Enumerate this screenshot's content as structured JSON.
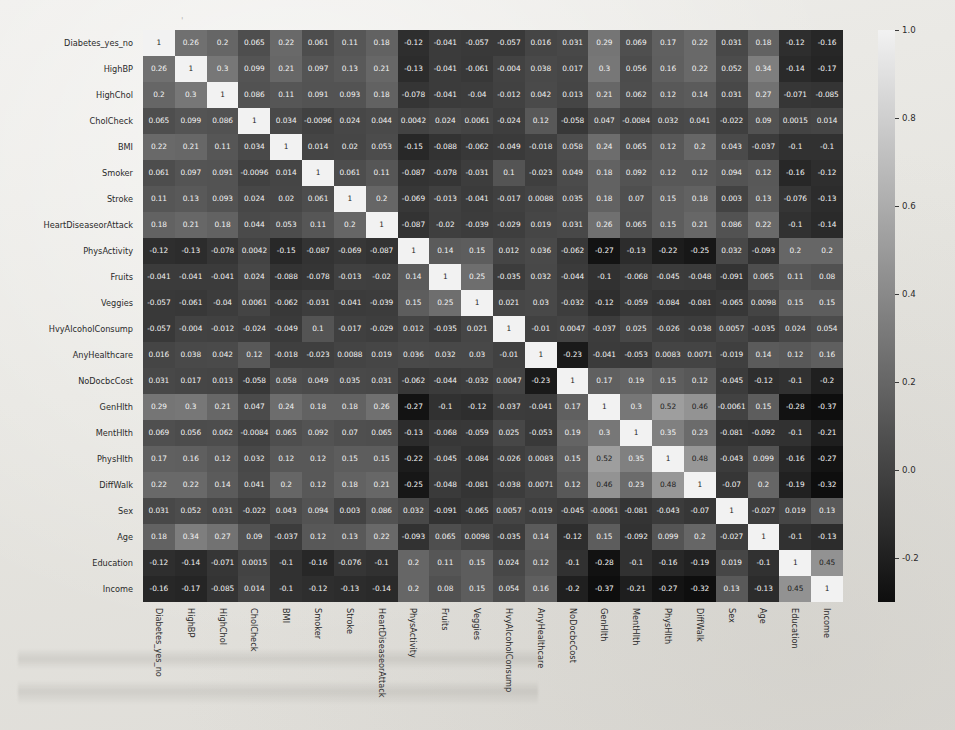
{
  "chart_data": {
    "type": "heatmap",
    "title": "",
    "xlabel": "",
    "ylabel": "",
    "colormap": "gray",
    "grid": false,
    "annotated": true,
    "legend_position": "right",
    "colorbar": {
      "vmin": -0.3,
      "vmax": 1.0,
      "ticks": [
        1.0,
        0.8,
        0.6,
        0.4,
        0.2,
        0.0,
        -0.2
      ],
      "tick_labels": [
        "1.0",
        "0.8",
        "0.6",
        "0.4",
        "0.2",
        "0.0",
        "-0.2"
      ],
      "low_color": "#1a1a1a",
      "high_color": "#f0f0f0"
    },
    "categories": [
      "Diabetes_yes_no",
      "HighBP",
      "HighChol",
      "CholCheck",
      "BMI",
      "Smoker",
      "Stroke",
      "HeartDiseaseorAttack",
      "PhysActivity",
      "Fruits",
      "Veggies",
      "HvyAlcoholConsump",
      "AnyHealthcare",
      "NoDocbcCost",
      "GenHlth",
      "MentHlth",
      "PhysHlth",
      "DiffWalk",
      "Sex",
      "Age",
      "Education",
      "Income"
    ],
    "x": [
      "Diabetes_yes_no",
      "HighBP",
      "HighChol",
      "CholCheck",
      "BMI",
      "Smoker",
      "Stroke",
      "HeartDiseaseorAttack",
      "PhysActivity",
      "Fruits",
      "Veggies",
      "HvyAlcoholConsump",
      "AnyHealthcare",
      "NoDocbcCost",
      "GenHlth",
      "MentHlth",
      "PhysHlth",
      "DiffWalk",
      "Sex",
      "Age",
      "Education",
      "Income"
    ],
    "y": [
      "Diabetes_yes_no",
      "HighBP",
      "HighChol",
      "CholCheck",
      "BMI",
      "Smoker",
      "Stroke",
      "HeartDiseaseorAttack",
      "PhysActivity",
      "Fruits",
      "Veggies",
      "HvyAlcoholConsump",
      "AnyHealthcare",
      "NoDocbcCost",
      "GenHlth",
      "MentHlth",
      "PhysHlth",
      "DiffWalk",
      "Sex",
      "Age",
      "Education",
      "Income"
    ],
    "cell_labels": [
      [
        "1",
        "0.26",
        "0.2",
        "0.065",
        "0.22",
        "0.061",
        "0.11",
        "0.18",
        "-0.12",
        "-0.041",
        "-0.057",
        "-0.057",
        "0.016",
        "0.031",
        "0.29",
        "0.069",
        "0.17",
        "0.22",
        "0.031",
        "0.18",
        "-0.12",
        "-0.16"
      ],
      [
        "0.26",
        "1",
        "0.3",
        "0.099",
        "0.21",
        "0.097",
        "0.13",
        "0.21",
        "-0.13",
        "-0.041",
        "-0.061",
        "-0.004",
        "0.038",
        "0.017",
        "0.3",
        "0.056",
        "0.16",
        "0.22",
        "0.052",
        "0.34",
        "-0.14",
        "-0.17"
      ],
      [
        "0.2",
        "0.3",
        "1",
        "0.086",
        "0.11",
        "0.091",
        "0.093",
        "0.18",
        "-0.078",
        "-0.041",
        "-0.04",
        "-0.012",
        "0.042",
        "0.013",
        "0.21",
        "0.062",
        "0.12",
        "0.14",
        "0.031",
        "0.27",
        "-0.071",
        "-0.085"
      ],
      [
        "0.065",
        "0.099",
        "0.086",
        "1",
        "0.034",
        "-0.0096",
        "0.024",
        "0.044",
        "0.0042",
        "0.024",
        "0.0061",
        "-0.024",
        "0.12",
        "-0.058",
        "0.047",
        "-0.0084",
        "0.032",
        "0.041",
        "-0.022",
        "0.09",
        "0.0015",
        "0.014"
      ],
      [
        "0.22",
        "0.21",
        "0.11",
        "0.034",
        "1",
        "0.014",
        "0.02",
        "0.053",
        "-0.15",
        "-0.088",
        "-0.062",
        "-0.049",
        "-0.018",
        "0.058",
        "0.24",
        "0.065",
        "0.12",
        "0.2",
        "0.043",
        "-0.037",
        "-0.1",
        "-0.1"
      ],
      [
        "0.061",
        "0.097",
        "0.091",
        "-0.0096",
        "0.014",
        "1",
        "0.061",
        "0.11",
        "-0.087",
        "-0.078",
        "-0.031",
        "0.1",
        "-0.023",
        "0.049",
        "0.18",
        "0.092",
        "0.12",
        "0.12",
        "0.094",
        "0.12",
        "-0.16",
        "-0.12"
      ],
      [
        "0.11",
        "0.13",
        "0.093",
        "0.024",
        "0.02",
        "0.061",
        "1",
        "0.2",
        "-0.069",
        "-0.013",
        "-0.041",
        "-0.017",
        "0.0088",
        "0.035",
        "0.18",
        "0.07",
        "0.15",
        "0.18",
        "0.003",
        "0.13",
        "-0.076",
        "-0.13"
      ],
      [
        "0.18",
        "0.21",
        "0.18",
        "0.044",
        "0.053",
        "0.11",
        "0.2",
        "1",
        "-0.087",
        "-0.02",
        "-0.039",
        "-0.029",
        "0.019",
        "0.031",
        "0.26",
        "0.065",
        "0.15",
        "0.21",
        "0.086",
        "0.22",
        "-0.1",
        "-0.14"
      ],
      [
        "-0.12",
        "-0.13",
        "-0.078",
        "0.0042",
        "-0.15",
        "-0.087",
        "-0.069",
        "-0.087",
        "1",
        "0.14",
        "0.15",
        "0.012",
        "0.036",
        "-0.062",
        "-0.27",
        "-0.13",
        "-0.22",
        "-0.25",
        "0.032",
        "-0.093",
        "0.2",
        "0.2"
      ],
      [
        "-0.041",
        "-0.041",
        "-0.041",
        "0.024",
        "-0.088",
        "-0.078",
        "-0.013",
        "-0.02",
        "0.14",
        "1",
        "0.25",
        "-0.035",
        "0.032",
        "-0.044",
        "-0.1",
        "-0.068",
        "-0.045",
        "-0.048",
        "-0.091",
        "0.065",
        "0.11",
        "0.08"
      ],
      [
        "-0.057",
        "-0.061",
        "-0.04",
        "0.0061",
        "-0.062",
        "-0.031",
        "-0.041",
        "-0.039",
        "0.15",
        "0.25",
        "1",
        "0.021",
        "0.03",
        "-0.032",
        "-0.12",
        "-0.059",
        "-0.084",
        "-0.081",
        "-0.065",
        "0.0098",
        "0.15",
        "0.15"
      ],
      [
        "-0.057",
        "-0.004",
        "-0.012",
        "-0.024",
        "-0.049",
        "0.1",
        "-0.017",
        "-0.029",
        "0.012",
        "-0.035",
        "0.021",
        "1",
        "-0.01",
        "0.0047",
        "-0.037",
        "0.025",
        "-0.026",
        "-0.038",
        "0.0057",
        "-0.035",
        "0.024",
        "0.054"
      ],
      [
        "0.016",
        "0.038",
        "0.042",
        "0.12",
        "-0.018",
        "-0.023",
        "0.0088",
        "0.019",
        "0.036",
        "0.032",
        "0.03",
        "-0.01",
        "1",
        "-0.23",
        "-0.041",
        "-0.053",
        "0.0083",
        "0.0071",
        "-0.019",
        "0.14",
        "0.12",
        "0.16"
      ],
      [
        "0.031",
        "0.017",
        "0.013",
        "-0.058",
        "0.058",
        "0.049",
        "0.035",
        "0.031",
        "-0.062",
        "-0.044",
        "-0.032",
        "0.0047",
        "-0.23",
        "1",
        "0.17",
        "0.19",
        "0.15",
        "0.12",
        "-0.045",
        "-0.12",
        "-0.1",
        "-0.2"
      ],
      [
        "0.29",
        "0.3",
        "0.21",
        "0.047",
        "0.24",
        "0.18",
        "0.18",
        "0.26",
        "-0.27",
        "-0.1",
        "-0.12",
        "-0.037",
        "-0.041",
        "0.17",
        "1",
        "0.3",
        "0.52",
        "0.46",
        "-0.0061",
        "0.15",
        "-0.28",
        "-0.37"
      ],
      [
        "0.069",
        "0.056",
        "0.062",
        "-0.0084",
        "0.065",
        "0.092",
        "0.07",
        "0.065",
        "-0.13",
        "-0.068",
        "-0.059",
        "0.025",
        "-0.053",
        "0.19",
        "0.3",
        "1",
        "0.35",
        "0.23",
        "-0.081",
        "-0.092",
        "-0.1",
        "-0.21"
      ],
      [
        "0.17",
        "0.16",
        "0.12",
        "0.032",
        "0.12",
        "0.12",
        "0.15",
        "0.15",
        "-0.22",
        "-0.045",
        "-0.084",
        "-0.026",
        "0.0083",
        "0.15",
        "0.52",
        "0.35",
        "1",
        "0.48",
        "-0.043",
        "0.099",
        "-0.16",
        "-0.27"
      ],
      [
        "0.22",
        "0.22",
        "0.14",
        "0.041",
        "0.2",
        "0.12",
        "0.18",
        "0.21",
        "-0.25",
        "-0.048",
        "-0.081",
        "-0.038",
        "0.0071",
        "0.12",
        "0.46",
        "0.23",
        "0.48",
        "1",
        "-0.07",
        "0.2",
        "-0.19",
        "-0.32"
      ],
      [
        "0.031",
        "0.052",
        "0.031",
        "-0.022",
        "0.043",
        "0.094",
        "0.003",
        "0.086",
        "0.032",
        "-0.091",
        "-0.065",
        "0.0057",
        "-0.019",
        "-0.045",
        "-0.0061",
        "-0.081",
        "-0.043",
        "-0.07",
        "1",
        "-0.027",
        "0.019",
        "0.13"
      ],
      [
        "0.18",
        "0.34",
        "0.27",
        "0.09",
        "-0.037",
        "0.12",
        "0.13",
        "0.22",
        "-0.093",
        "0.065",
        "0.0098",
        "-0.035",
        "0.14",
        "-0.12",
        "0.15",
        "-0.092",
        "0.099",
        "0.2",
        "-0.027",
        "1",
        "-0.1",
        "-0.13"
      ],
      [
        "-0.12",
        "-0.14",
        "-0.071",
        "0.0015",
        "-0.1",
        "-0.16",
        "-0.076",
        "-0.1",
        "0.2",
        "0.11",
        "0.15",
        "0.024",
        "0.12",
        "-0.1",
        "-0.28",
        "-0.1",
        "-0.16",
        "-0.19",
        "0.019",
        "-0.1",
        "1",
        "0.45"
      ],
      [
        "-0.16",
        "-0.17",
        "-0.085",
        "0.014",
        "-0.1",
        "-0.12",
        "-0.13",
        "-0.14",
        "0.2",
        "0.08",
        "0.15",
        "0.054",
        "0.16",
        "-0.2",
        "-0.37",
        "-0.21",
        "-0.27",
        "-0.32",
        "0.13",
        "-0.13",
        "0.45",
        "1"
      ]
    ],
    "values": [
      [
        1,
        0.26,
        0.2,
        0.065,
        0.22,
        0.061,
        0.11,
        0.18,
        -0.12,
        -0.041,
        -0.057,
        -0.057,
        0.016,
        0.031,
        0.29,
        0.069,
        0.17,
        0.22,
        0.031,
        0.18,
        -0.12,
        -0.16
      ],
      [
        0.26,
        1,
        0.3,
        0.099,
        0.21,
        0.097,
        0.13,
        0.21,
        -0.13,
        -0.041,
        -0.061,
        -0.004,
        0.038,
        0.017,
        0.3,
        0.056,
        0.16,
        0.22,
        0.052,
        0.34,
        -0.14,
        -0.17
      ],
      [
        0.2,
        0.3,
        1,
        0.086,
        0.11,
        0.091,
        0.093,
        0.18,
        -0.078,
        -0.041,
        -0.04,
        -0.012,
        0.042,
        0.013,
        0.21,
        0.062,
        0.12,
        0.14,
        0.031,
        0.27,
        -0.071,
        -0.085
      ],
      [
        0.065,
        0.099,
        0.086,
        1,
        0.034,
        -0.0096,
        0.024,
        0.044,
        0.0042,
        0.024,
        0.0061,
        -0.024,
        0.12,
        -0.058,
        0.047,
        -0.0084,
        0.032,
        0.041,
        -0.022,
        0.09,
        0.0015,
        0.014
      ],
      [
        0.22,
        0.21,
        0.11,
        0.034,
        1,
        0.014,
        0.02,
        0.053,
        -0.15,
        -0.088,
        -0.062,
        -0.049,
        -0.018,
        0.058,
        0.24,
        0.065,
        0.12,
        0.2,
        0.043,
        -0.037,
        -0.1,
        -0.1
      ],
      [
        0.061,
        0.097,
        0.091,
        -0.0096,
        0.014,
        1,
        0.061,
        0.11,
        -0.087,
        -0.078,
        -0.031,
        0.1,
        -0.023,
        0.049,
        0.18,
        0.092,
        0.12,
        0.12,
        0.094,
        0.12,
        -0.16,
        -0.12
      ],
      [
        0.11,
        0.13,
        0.093,
        0.024,
        0.02,
        0.061,
        1,
        0.2,
        -0.069,
        -0.013,
        -0.041,
        -0.017,
        0.0088,
        0.035,
        0.18,
        0.07,
        0.15,
        0.18,
        0.003,
        0.13,
        -0.076,
        -0.13
      ],
      [
        0.18,
        0.21,
        0.18,
        0.044,
        0.053,
        0.11,
        0.2,
        1,
        -0.087,
        -0.02,
        -0.039,
        -0.029,
        0.019,
        0.031,
        0.26,
        0.065,
        0.15,
        0.21,
        0.086,
        0.22,
        -0.1,
        -0.14
      ],
      [
        -0.12,
        -0.13,
        -0.078,
        0.0042,
        -0.15,
        -0.087,
        -0.069,
        -0.087,
        1,
        0.14,
        0.15,
        0.012,
        0.036,
        -0.062,
        -0.27,
        -0.13,
        -0.22,
        -0.25,
        0.032,
        -0.093,
        0.2,
        0.2
      ],
      [
        -0.041,
        -0.041,
        -0.041,
        0.024,
        -0.088,
        -0.078,
        -0.013,
        -0.02,
        0.14,
        1,
        0.25,
        -0.035,
        0.032,
        -0.044,
        -0.1,
        -0.068,
        -0.045,
        -0.048,
        -0.091,
        0.065,
        0.11,
        0.08
      ],
      [
        -0.057,
        -0.061,
        -0.04,
        0.0061,
        -0.062,
        -0.031,
        -0.041,
        -0.039,
        0.15,
        0.25,
        1,
        0.021,
        0.03,
        -0.032,
        -0.12,
        -0.059,
        -0.084,
        -0.081,
        -0.065,
        0.0098,
        0.15,
        0.15
      ],
      [
        -0.057,
        -0.004,
        -0.012,
        -0.024,
        -0.049,
        0.1,
        -0.017,
        -0.029,
        0.012,
        -0.035,
        0.021,
        1,
        -0.01,
        0.0047,
        -0.037,
        0.025,
        -0.026,
        -0.038,
        0.0057,
        -0.035,
        0.024,
        0.054
      ],
      [
        0.016,
        0.038,
        0.042,
        0.12,
        -0.018,
        -0.023,
        0.0088,
        0.019,
        0.036,
        0.032,
        0.03,
        -0.01,
        1,
        -0.23,
        -0.041,
        -0.053,
        0.0083,
        0.0071,
        -0.019,
        0.14,
        0.12,
        0.16
      ],
      [
        0.031,
        0.017,
        0.013,
        -0.058,
        0.058,
        0.049,
        0.035,
        0.031,
        -0.062,
        -0.044,
        -0.032,
        0.0047,
        -0.23,
        1,
        0.17,
        0.19,
        0.15,
        0.12,
        -0.045,
        -0.12,
        -0.1,
        -0.2
      ],
      [
        0.29,
        0.3,
        0.21,
        0.047,
        0.24,
        0.18,
        0.18,
        0.26,
        -0.27,
        -0.1,
        -0.12,
        -0.037,
        -0.041,
        0.17,
        1,
        0.3,
        0.52,
        0.46,
        -0.0061,
        0.15,
        -0.28,
        -0.37
      ],
      [
        0.069,
        0.056,
        0.062,
        -0.0084,
        0.065,
        0.092,
        0.07,
        0.065,
        -0.13,
        -0.068,
        -0.059,
        0.025,
        -0.053,
        0.19,
        0.3,
        1,
        0.35,
        0.23,
        -0.081,
        -0.092,
        -0.1,
        -0.21
      ],
      [
        0.17,
        0.16,
        0.12,
        0.032,
        0.12,
        0.12,
        0.15,
        0.15,
        -0.22,
        -0.045,
        -0.084,
        -0.026,
        0.0083,
        0.15,
        0.52,
        0.35,
        1,
        0.48,
        -0.043,
        0.099,
        -0.16,
        -0.27
      ],
      [
        0.22,
        0.22,
        0.14,
        0.041,
        0.2,
        0.12,
        0.18,
        0.21,
        -0.25,
        -0.048,
        -0.081,
        -0.038,
        0.0071,
        0.12,
        0.46,
        0.23,
        0.48,
        1,
        -0.07,
        0.2,
        -0.19,
        -0.32
      ],
      [
        0.031,
        0.052,
        0.031,
        -0.022,
        0.043,
        0.094,
        0.003,
        0.086,
        0.032,
        -0.091,
        -0.065,
        0.0057,
        -0.019,
        -0.045,
        -0.0061,
        -0.081,
        -0.043,
        -0.07,
        1,
        -0.027,
        0.019,
        0.13
      ],
      [
        0.18,
        0.34,
        0.27,
        0.09,
        -0.037,
        0.12,
        0.13,
        0.22,
        -0.093,
        0.065,
        0.0098,
        -0.035,
        0.14,
        -0.12,
        0.15,
        -0.092,
        0.099,
        0.2,
        -0.027,
        1,
        -0.1,
        -0.13
      ],
      [
        -0.12,
        -0.14,
        -0.071,
        0.0015,
        -0.1,
        -0.16,
        -0.076,
        -0.1,
        0.2,
        0.11,
        0.15,
        0.024,
        0.12,
        -0.1,
        -0.28,
        -0.1,
        -0.16,
        -0.19,
        0.019,
        -0.1,
        1,
        0.45
      ],
      [
        -0.16,
        -0.17,
        -0.085,
        0.014,
        -0.1,
        -0.12,
        -0.13,
        -0.14,
        0.2,
        0.08,
        0.15,
        0.054,
        0.16,
        -0.2,
        -0.37,
        -0.21,
        -0.27,
        -0.32,
        0.13,
        -0.13,
        0.45,
        1
      ]
    ]
  }
}
